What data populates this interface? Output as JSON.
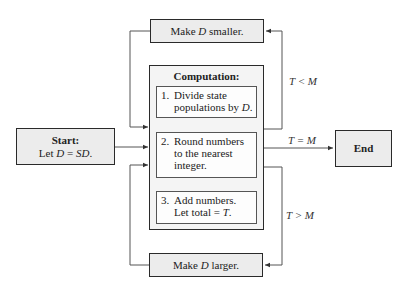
{
  "diagram": {
    "type": "flowchart",
    "nodes": {
      "start": {
        "title": "Start:",
        "text_prefix": "Let ",
        "var": "D",
        "text_mid": " = ",
        "expr": "SD",
        "text_suffix": "."
      },
      "smaller": {
        "prefix": "Make ",
        "var": "D",
        "suffix": " smaller."
      },
      "larger": {
        "prefix": "Make ",
        "var": "D",
        "suffix": " larger."
      },
      "computation": {
        "title": "Computation:",
        "steps": [
          {
            "num": "1.",
            "line1": "Divide state",
            "line2_prefix": "populations by ",
            "line2_var": "D",
            "line2_suffix": "."
          },
          {
            "num": "2.",
            "line1": "Round numbers",
            "line2": "to the nearest",
            "line3": "integer."
          },
          {
            "num": "3.",
            "line1": "Add numbers.",
            "line2_prefix": "Let total = ",
            "line2_var": "T",
            "line2_suffix": "."
          }
        ]
      },
      "end": {
        "label": "End"
      }
    },
    "edges": {
      "lt": "T < M",
      "eq": "T = M",
      "gt": "T > M"
    },
    "colors": {
      "box_fill": "#ececec",
      "border": "#2a2a2a",
      "line": "#555555"
    }
  }
}
